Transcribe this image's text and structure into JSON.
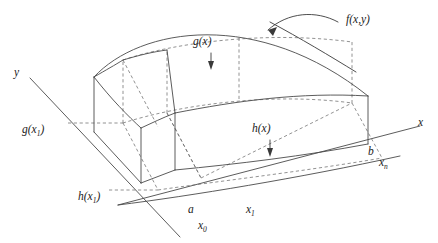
{
  "figure": {
    "background_color": "#ffffff",
    "line_color": "#4a4a4a",
    "dash_color": "#6e6e6e",
    "text_color": "#1b1b1b",
    "width": 438,
    "height": 243
  },
  "axes": {
    "x_label": "x",
    "y_label": "y"
  },
  "labels": {
    "surface": "f(x,y)",
    "upper_curve": "g(x)",
    "lower_curve": "h(x)",
    "upper_curve_at_x1": "g(x",
    "upper_curve_at_x1_sub": "1",
    "upper_curve_at_x1_close": ")",
    "lower_curve_at_x1": "h(x",
    "lower_curve_at_x1_sub": "1",
    "lower_curve_at_x1_close": ")",
    "left_bound": "a",
    "right_bound": "b",
    "partition_first": "x",
    "partition_first_sub": "0",
    "partition_second": "x",
    "partition_second_sub": "1",
    "partition_last": "x",
    "partition_last_sub": "n"
  },
  "annotations": {
    "surface_arrow": "curved-arrow-to-surface",
    "g_arrow": "down-arrow",
    "h_arrow": "down-arrow"
  }
}
